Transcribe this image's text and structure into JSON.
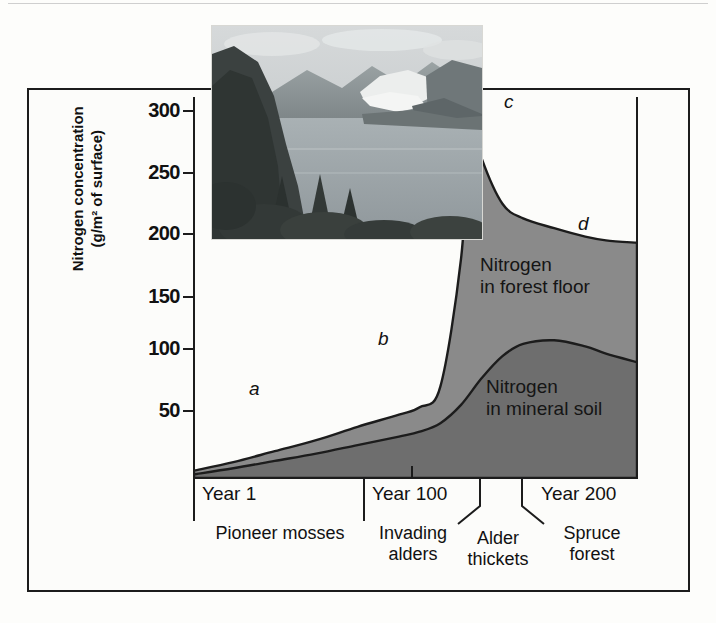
{
  "figure": {
    "yaxis_title_line1": "Nitrogen concentration",
    "yaxis_title_line2": "(g/m² of surface)"
  },
  "inset": {
    "name": "glacier-bay-fjord-photo",
    "description": "Glacier Bay fjord with retreating glacier, forested slopes and water"
  },
  "chart_data": {
    "type": "area",
    "title": "",
    "xlabel": "",
    "ylabel": "Nitrogen concentration (g/m² of surface)",
    "xlim": [
      1,
      215
    ],
    "ylim": [
      0,
      320
    ],
    "yticks": [
      50,
      100,
      150,
      200,
      250,
      300
    ],
    "ytick_labels": [
      "50",
      "100",
      "150",
      "200",
      "250",
      "300"
    ],
    "xticks": [
      1,
      100,
      200
    ],
    "xtick_labels": [
      "Year 1",
      "Year 100",
      "Year 200"
    ],
    "grid": false,
    "legend": "inline-labels",
    "stacked": true,
    "series": [
      {
        "name": "Nitrogen in mineral soil",
        "color": "#6e6e6e",
        "x": [
          1,
          20,
          40,
          60,
          80,
          100,
          110,
          120,
          130,
          140,
          150,
          160,
          175,
          190,
          200,
          215
        ],
        "values": [
          3,
          8,
          14,
          20,
          27,
          34,
          38,
          45,
          60,
          82,
          100,
          110,
          113,
          108,
          102,
          95
        ]
      },
      {
        "name": "Nitrogen in forest floor",
        "color": "#8a8a8a",
        "x": [
          1,
          20,
          40,
          60,
          80,
          100,
          110,
          120,
          130,
          135,
          140,
          150,
          160,
          175,
          190,
          200,
          215
        ],
        "values": [
          6,
          13,
          22,
          31,
          42,
          52,
          58,
          75,
          180,
          295,
          262,
          225,
          213,
          205,
          198,
          195,
          193
        ]
      }
    ],
    "annotations": [
      {
        "label": "a",
        "x": 45,
        "y": 30,
        "note": "slow early nitrogen accumulation under pioneer mosses"
      },
      {
        "label": "b",
        "x": 103,
        "y": 72,
        "note": "upturn as invading alders arrive"
      },
      {
        "label": "c",
        "x": 135,
        "y": 305,
        "note": "peak nitrogen in alder thickets"
      },
      {
        "label": "d",
        "x": 178,
        "y": 213,
        "note": "decline as spruce forest replaces alder"
      }
    ],
    "stage_labels": [
      {
        "label": "Pioneer mosses",
        "start_year": 1,
        "end_year": 100
      },
      {
        "label": "Invading\nalders",
        "start_year": 100,
        "end_year": 130
      },
      {
        "label": "Alder\nthickets",
        "start_year": 130,
        "end_year": 152
      },
      {
        "label": "Spruce\nforest",
        "start_year": 152,
        "end_year": 215
      }
    ],
    "series_inline_labels": [
      {
        "text_line1": "Nitrogen",
        "text_line2": "in forest floor"
      },
      {
        "text_line1": "Nitrogen",
        "text_line2": "in mineral soil"
      }
    ]
  },
  "axis": {
    "ytick_0": "300",
    "ytick_1": "250",
    "ytick_2": "200",
    "ytick_3": "150",
    "ytick_4": "100",
    "ytick_5": "50",
    "xlab_0": "Year 1",
    "xlab_1": "Year 100",
    "xlab_2": "Year 200"
  },
  "stages": {
    "s0": "Pioneer mosses",
    "s1_a": "Invading",
    "s1_b": "alders",
    "s2_a": "Alder",
    "s2_b": "thickets",
    "s3_a": "Spruce",
    "s3_b": "forest"
  },
  "annotations": {
    "a": "a",
    "b": "b",
    "c": "c",
    "d": "d"
  },
  "series_labels": {
    "forest_floor_l1": "Nitrogen",
    "forest_floor_l2": "in forest floor",
    "mineral_soil_l1": "Nitrogen",
    "mineral_soil_l2": "in mineral soil"
  },
  "colors": {
    "forest_floor_fill": "#8a8a8a",
    "mineral_soil_fill": "#6e6e6e",
    "outline": "#1c1c1c",
    "frame": "#1c1c1c",
    "background": "#fcfcfa"
  }
}
